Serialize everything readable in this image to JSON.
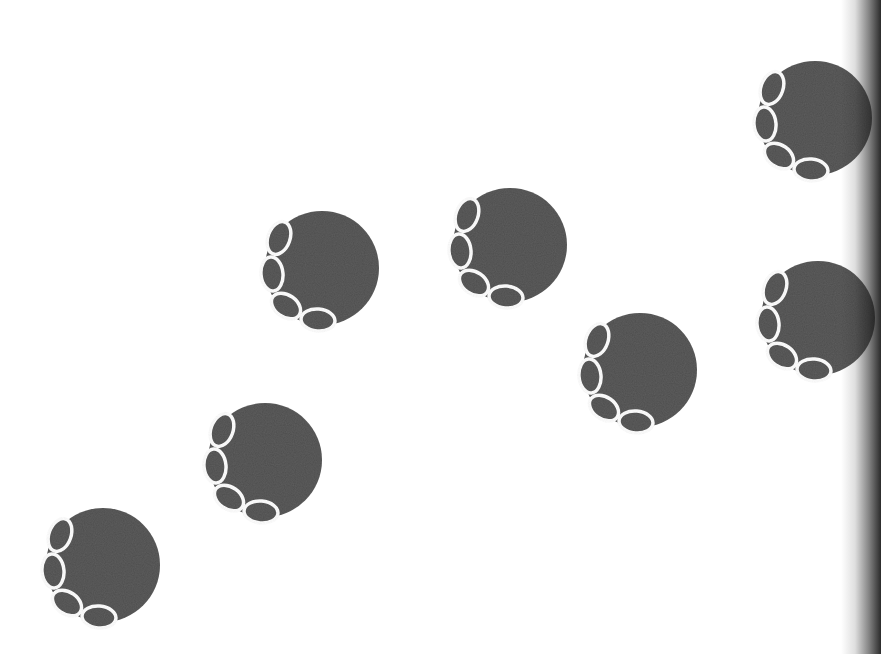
{
  "page": {
    "background": "#ffffff",
    "print_color": "#4d4d4d",
    "outline_color": "#ffffff",
    "gutter_shadow": true
  },
  "prints": [
    {
      "id": "print-1",
      "cx": 103,
      "cy": 565,
      "r": 57
    },
    {
      "id": "print-2",
      "cx": 265,
      "cy": 460,
      "r": 57
    },
    {
      "id": "print-3",
      "cx": 322,
      "cy": 268,
      "r": 57
    },
    {
      "id": "print-4",
      "cx": 510,
      "cy": 245,
      "r": 57
    },
    {
      "id": "print-5",
      "cx": 640,
      "cy": 370,
      "r": 57
    },
    {
      "id": "print-6",
      "cx": 815,
      "cy": 118,
      "r": 57
    },
    {
      "id": "print-7",
      "cx": 818,
      "cy": 318,
      "r": 57
    }
  ],
  "toes": [
    {
      "dx": -43,
      "dy": -30,
      "rx": 11,
      "ry": 17,
      "rot": 20
    },
    {
      "dx": -50,
      "dy": 6,
      "rx": 11,
      "ry": 17,
      "rot": -5
    },
    {
      "dx": -36,
      "dy": 38,
      "rx": 16,
      "ry": 11,
      "rot": 35
    },
    {
      "dx": -4,
      "dy": 52,
      "rx": 17,
      "ry": 11,
      "rot": 5
    }
  ]
}
